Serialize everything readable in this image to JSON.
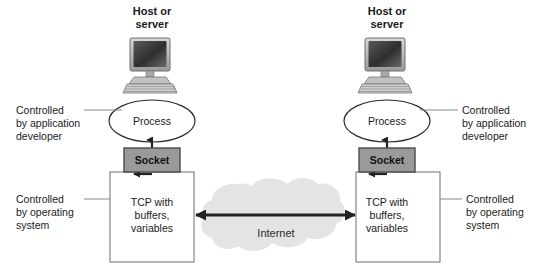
{
  "figure": {
    "background_color": "#ffffff"
  },
  "colors": {
    "socket_fill": "#9a9a9a",
    "socket_stroke": "#4a4a4a",
    "cloud_fill": "#e4e4e4",
    "box_stroke": "#7a7a7a",
    "ellipse_stroke": "#2a2a2a",
    "arrow_color": "#222222",
    "leader_line": "#888888",
    "text_color": "#1a1a1a",
    "monitor_screen": "#3a3a3a",
    "monitor_body": "#b5b5b5"
  },
  "left_host": {
    "title_line1": "Host or",
    "title_line2": "server",
    "computer_icon": "desktop-computer-icon",
    "process_label": "Process",
    "socket_label": "Socket",
    "tcp_label_line1": "TCP with",
    "tcp_label_line2": "buffers,",
    "tcp_label_line3": "variables",
    "annotation_app": {
      "line1": "Controlled",
      "line2": "by application",
      "line3": "developer"
    },
    "annotation_os": {
      "line1": "Controlled",
      "line2": "by operating",
      "line3": "system"
    }
  },
  "right_host": {
    "title_line1": "Host or",
    "title_line2": "server",
    "computer_icon": "desktop-computer-icon",
    "process_label": "Process",
    "socket_label": "Socket",
    "tcp_label_line1": "TCP with",
    "tcp_label_line2": "buffers,",
    "tcp_label_line3": "variables",
    "annotation_app": {
      "line1": "Controlled",
      "line2": "by application",
      "line3": "developer"
    },
    "annotation_os": {
      "line1": "Controlled",
      "line2": "by operating",
      "line3": "system"
    }
  },
  "network": {
    "cloud_label": "Internet",
    "cloud_icon": "cloud-shape",
    "link_arrow": "bidirectional-arrow"
  }
}
